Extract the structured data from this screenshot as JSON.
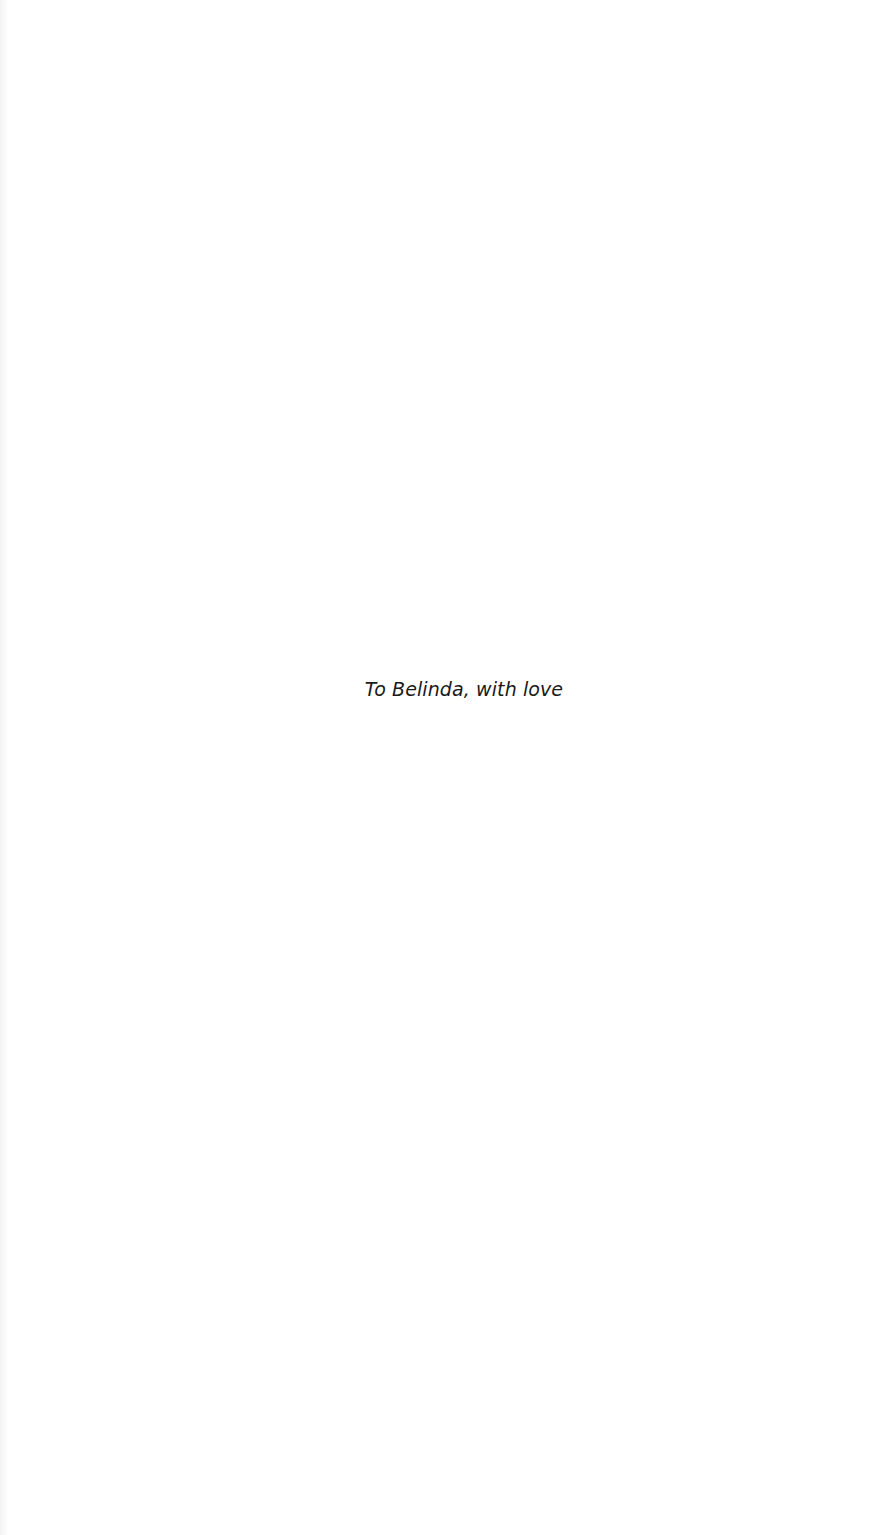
{
  "page": {
    "dedication": "To Belinda, with love"
  }
}
